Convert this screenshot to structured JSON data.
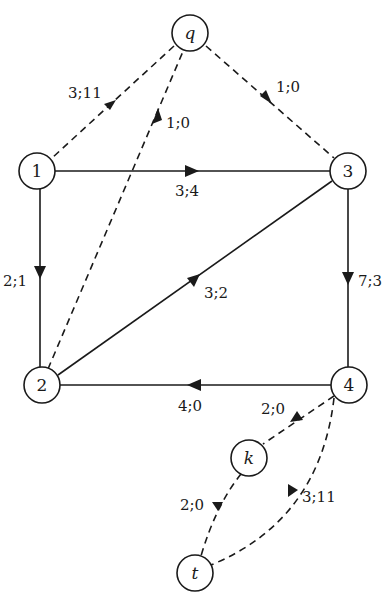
{
  "diagram": {
    "type": "flow-network",
    "nodes": [
      {
        "id": "q",
        "label": "q",
        "italic": true,
        "x": 190,
        "y": 33
      },
      {
        "id": "1",
        "label": "1",
        "italic": false,
        "x": 37,
        "y": 171
      },
      {
        "id": "3",
        "label": "3",
        "italic": false,
        "x": 348,
        "y": 171
      },
      {
        "id": "2",
        "label": "2",
        "italic": false,
        "x": 42,
        "y": 385
      },
      {
        "id": "4",
        "label": "4",
        "italic": false,
        "x": 349,
        "y": 385
      },
      {
        "id": "k",
        "label": "k",
        "italic": true,
        "x": 249,
        "y": 458
      },
      {
        "id": "t",
        "label": "t",
        "italic": true,
        "x": 195,
        "y": 573
      }
    ],
    "edges": [
      {
        "from": "q",
        "to": "1",
        "label": "3;11",
        "style": "dashed"
      },
      {
        "from": "2",
        "to": "q",
        "label": "1;0",
        "style": "dashed"
      },
      {
        "from": "q",
        "to": "3",
        "label": "1;0",
        "style": "dashed"
      },
      {
        "from": "1",
        "to": "3",
        "label": "3;4",
        "style": "solid"
      },
      {
        "from": "1",
        "to": "2",
        "label": "2;1",
        "style": "solid"
      },
      {
        "from": "2",
        "to": "3",
        "label": "3;2",
        "style": "solid"
      },
      {
        "from": "3",
        "to": "4",
        "label": "7;3",
        "style": "solid"
      },
      {
        "from": "4",
        "to": "2",
        "label": "4;0",
        "style": "solid"
      },
      {
        "from": "4",
        "to": "k",
        "label": "2;0",
        "style": "dashed"
      },
      {
        "from": "k",
        "to": "t",
        "label": "2;0",
        "style": "dashed"
      },
      {
        "from": "4",
        "to": "t",
        "label": "3;11",
        "style": "dashed"
      }
    ]
  },
  "nodes": {
    "q": "q",
    "n1": "1",
    "n2": "2",
    "n3": "3",
    "n4": "4",
    "k": "k",
    "t": "t"
  },
  "edge_labels": {
    "q_1": "3;11",
    "two_q": "1;0",
    "q_3": "1;0",
    "one_3": "3;4",
    "one_2": "2;1",
    "two_3": "3;2",
    "three_4": "7;3",
    "four_2": "4;0",
    "four_k": "2;0",
    "k_t": "2;0",
    "four_t": "3;11"
  }
}
